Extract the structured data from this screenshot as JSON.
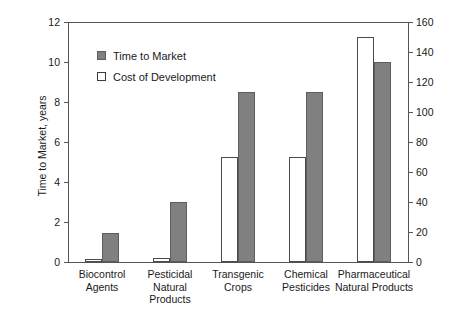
{
  "chart_data": {
    "type": "bar",
    "title": "",
    "subtitle": "",
    "categories": [
      "Biocontrol Agents",
      "Pesticidal Natural Products",
      "Transgenic Crops",
      "Chemical Pesticides",
      "Pharmaceutical Natural Products"
    ],
    "category_lines": [
      [
        "Biocontrol",
        "Agents"
      ],
      [
        "Pesticidal",
        "Natural",
        "Products"
      ],
      [
        "Transgenic",
        "Crops"
      ],
      [
        "Chemical",
        "Pesticides"
      ],
      [
        "Pharmaceutical",
        "Natural Products"
      ]
    ],
    "series": [
      {
        "name": "Time to Market",
        "axis": "left",
        "unit": "years",
        "color": "#808080",
        "values": [
          1.45,
          3.0,
          8.5,
          8.5,
          10.0
        ]
      },
      {
        "name": "Cost of Development",
        "axis": "right",
        "unit": "millions of dollars",
        "color": "#ffffff",
        "values": [
          2,
          3,
          70,
          70,
          150
        ]
      }
    ],
    "xlabel": "",
    "ylabel": "Time to Market, years",
    "y2label": "Cost of Development, millions of dollars",
    "ylim": [
      0,
      12
    ],
    "y2lim": [
      0,
      160
    ],
    "yticks": [
      "0",
      "2",
      "4",
      "6",
      "8",
      "10",
      "12"
    ],
    "ytick_values": [
      0,
      2,
      4,
      6,
      8,
      10,
      12
    ],
    "y2ticks": [
      "0",
      "20",
      "40",
      "60",
      "80",
      "100",
      "120",
      "140",
      "160"
    ],
    "y2tick_values": [
      0,
      20,
      40,
      60,
      80,
      100,
      120,
      140,
      160
    ],
    "grid": false,
    "legend_position": "upper-left-inside",
    "legend": [
      {
        "label": "Time to Market",
        "swatch": "gray"
      },
      {
        "label": "Cost of Development",
        "swatch": "white"
      }
    ]
  },
  "colors": {
    "bar_gray": "#808080",
    "bar_gray_edge": "#5d5d5d",
    "bar_white": "#ffffff",
    "bar_white_edge": "#4a4a4a",
    "axis": "#555555",
    "text": "#1a1a1a",
    "background": "#ffffff"
  }
}
